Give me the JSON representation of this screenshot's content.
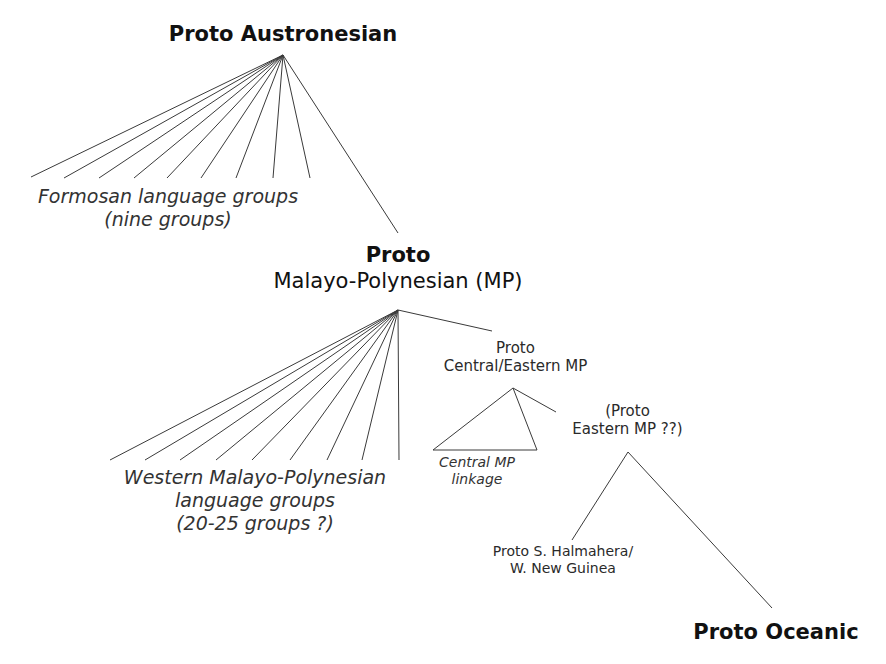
{
  "diagram": {
    "type": "language family tree",
    "nodes": {
      "pan": {
        "lines": [
          "Proto Austronesian"
        ]
      },
      "formosan": {
        "lines": [
          "Formosan language groups",
          "(nine groups)"
        ],
        "branch_count": 9
      },
      "pmp": {
        "lines": [
          "Proto",
          "Malayo-Polynesian (MP)"
        ]
      },
      "wmp": {
        "lines": [
          "Western Malayo-Polynesian",
          "language groups",
          "(20-25 groups ?)"
        ],
        "branch_count": 9
      },
      "pcemp": {
        "lines": [
          "Proto",
          "Central/Eastern MP"
        ]
      },
      "cmp": {
        "lines": [
          "Central MP",
          "linkage"
        ]
      },
      "pemp": {
        "lines": [
          "(Proto",
          "Eastern MP ??)"
        ]
      },
      "pshwng": {
        "lines": [
          "Proto S. Halmahera/",
          "W. New Guinea"
        ]
      },
      "poc": {
        "lines": [
          "Proto Oceanic"
        ]
      }
    },
    "edges": [
      [
        "pan",
        "formosan"
      ],
      [
        "pan",
        "pmp"
      ],
      [
        "pmp",
        "wmp"
      ],
      [
        "pmp",
        "pcemp"
      ],
      [
        "pcemp",
        "cmp"
      ],
      [
        "pcemp",
        "pemp"
      ],
      [
        "pemp",
        "pshwng"
      ],
      [
        "pemp",
        "poc"
      ]
    ],
    "colors": {
      "line": "#3a3a3a",
      "text": "#2a2a2a",
      "background": "#ffffff"
    }
  }
}
